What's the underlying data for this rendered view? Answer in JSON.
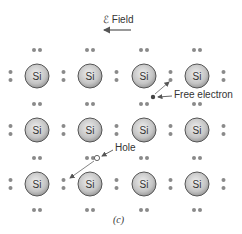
{
  "figure": {
    "field_label": "ℰ Field",
    "free_electron_label": "Free electron",
    "hole_label": "Hole",
    "caption": "(c)",
    "atom_label": "Si"
  },
  "lattice": {
    "columns": [
      37,
      90,
      144,
      197
    ],
    "rows": [
      76,
      130,
      184
    ],
    "atom_radius": 12,
    "colors": {
      "atom_fill_center": "#e6e6e6",
      "atom_fill_edge": "#9a9a9a",
      "atom_stroke": "#555555",
      "electron": "#8a8a8a",
      "arrow": "#555555"
    }
  },
  "free_electron": {
    "x": 153,
    "y": 97
  },
  "hole": {
    "x": 97,
    "y": 158
  }
}
